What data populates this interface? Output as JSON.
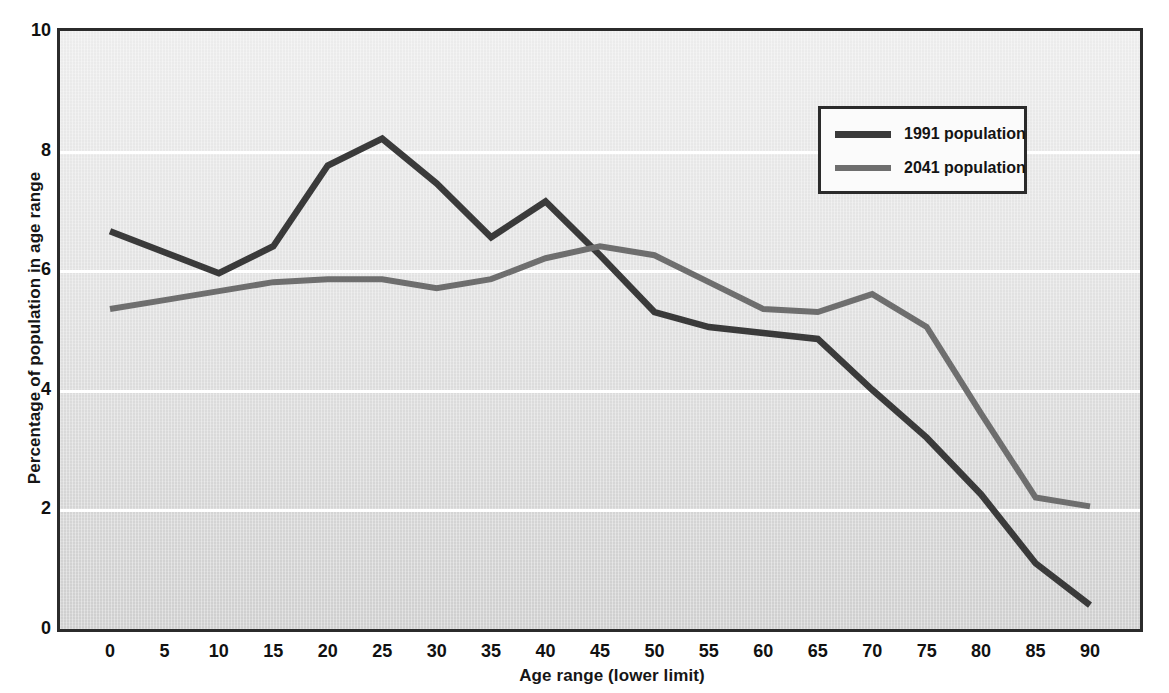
{
  "chart_data": {
    "type": "line",
    "title": "",
    "xlabel": "Age range (lower limit)",
    "ylabel": "Percentage of population in age range",
    "x": [
      0,
      5,
      10,
      15,
      20,
      25,
      30,
      35,
      40,
      45,
      50,
      55,
      60,
      65,
      70,
      75,
      80,
      85,
      90
    ],
    "categories": [
      "0",
      "5",
      "10",
      "15",
      "20",
      "25",
      "30",
      "35",
      "40",
      "45",
      "50",
      "55",
      "60",
      "65",
      "70",
      "75",
      "80",
      "85",
      "90"
    ],
    "xtick_labels": [
      "0",
      "5",
      "10",
      "15",
      "20",
      "25",
      "30",
      "35",
      "40",
      "45",
      "50",
      "55",
      "60",
      "65",
      "70",
      "75",
      "80",
      "85",
      "90"
    ],
    "ytick_labels": [
      "0",
      "2",
      "4",
      "6",
      "8",
      "10"
    ],
    "yticks": [
      0,
      2,
      4,
      6,
      8,
      10
    ],
    "xlim": [
      0,
      90
    ],
    "ylim": [
      0,
      10
    ],
    "grid": "horizontal-white-gridlines",
    "legend_position": "top-right",
    "series": [
      {
        "name": "1991 population",
        "color": "#3a3a3a",
        "values": [
          6.65,
          6.3,
          5.95,
          6.4,
          7.75,
          8.2,
          7.45,
          6.55,
          7.15,
          6.25,
          5.3,
          5.05,
          4.95,
          4.85,
          4.0,
          3.2,
          2.25,
          1.1,
          0.4
        ]
      },
      {
        "name": "2041 population",
        "color": "#6e6e6e",
        "values": [
          5.35,
          5.5,
          5.65,
          5.8,
          5.85,
          5.85,
          5.7,
          5.85,
          6.2,
          6.4,
          6.25,
          5.8,
          5.35,
          5.3,
          5.6,
          5.05,
          3.6,
          2.2,
          2.05
        ]
      }
    ]
  },
  "legend": {
    "items": [
      {
        "label": "1991 population",
        "color": "#3a3a3a"
      },
      {
        "label": "2041 population",
        "color": "#6e6e6e"
      }
    ]
  },
  "axes": {
    "x_title": "Age range (lower limit)",
    "y_title": "Percentage of population in age range"
  }
}
